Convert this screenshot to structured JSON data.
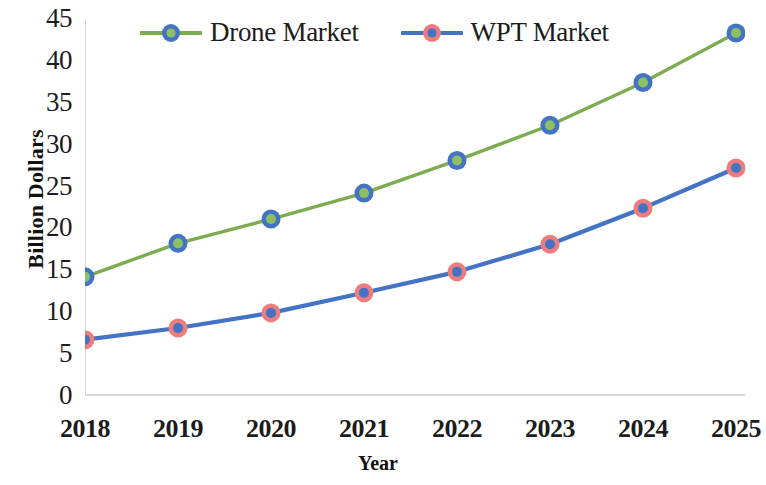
{
  "chart_data": {
    "type": "line",
    "title": "",
    "xlabel": "Year",
    "ylabel": "Billion Dollars",
    "categories": [
      "2018",
      "2019",
      "2020",
      "2021",
      "2022",
      "2023",
      "2024",
      "2025"
    ],
    "x": [
      2018,
      2019,
      2020,
      2021,
      2022,
      2023,
      2024,
      2025
    ],
    "series": [
      {
        "name": "Drone Market",
        "values": [
          14.1,
          18.1,
          21.0,
          24.1,
          28.0,
          32.2,
          37.3,
          43.2
        ],
        "line_color": "#7cab50",
        "marker_ring_color": "#4472c4",
        "marker_fill_color": "#8cc063"
      },
      {
        "name": "WPT Market",
        "values": [
          6.6,
          8.0,
          9.8,
          12.2,
          14.7,
          18.0,
          22.3,
          27.1
        ],
        "line_color": "#4472c4",
        "marker_ring_color": "#ed7d7d",
        "marker_fill_color": "#4472c4"
      }
    ],
    "ylim": [
      0,
      45
    ],
    "ytick_values": [
      0,
      5,
      10,
      15,
      20,
      25,
      30,
      35,
      40,
      45
    ],
    "ytick_labels": [
      "0",
      "5",
      "10",
      "15",
      "20",
      "25",
      "30",
      "35",
      "40",
      "45"
    ],
    "grid": false,
    "legend_position": "top-left-inside",
    "axis_line_color": "#c9c9c9"
  },
  "axes": {
    "y_title": "Billion Dollars",
    "x_title": "Year"
  },
  "legend": {
    "entries": [
      {
        "label": "Drone Market"
      },
      {
        "label": "WPT Market"
      }
    ]
  }
}
